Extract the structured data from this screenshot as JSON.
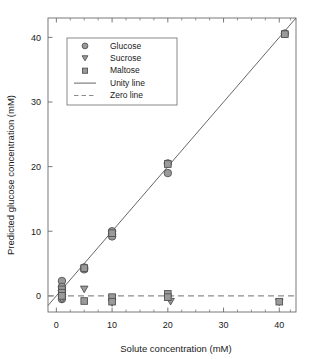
{
  "chart_data": {
    "type": "scatter",
    "title": "",
    "xlabel": "Solute concentration (mM)",
    "ylabel": "Predicted glucose concentration (mM)",
    "xlim": [
      -1.5,
      43
    ],
    "ylim": [
      -2.5,
      43
    ],
    "xticks": [
      0,
      10,
      20,
      30,
      40
    ],
    "yticks": [
      0,
      10,
      20,
      30,
      40
    ],
    "xtick_labels": [
      "0",
      "10",
      "20",
      "30",
      "40"
    ],
    "ytick_labels": [
      "0",
      "10",
      "20",
      "30",
      "40"
    ],
    "minor_xticks": [
      2.5,
      5,
      7.5,
      12.5,
      15,
      17.5,
      22.5,
      25,
      27.5,
      32.5,
      35,
      37.5,
      42
    ],
    "grid": false,
    "legend_position": "upper-left",
    "marker_fill": "#9a9a9a",
    "marker_edge": "#4d4d4d",
    "line_color": "#555555",
    "zero_line_color": "#8c8c8c",
    "frame_color": "#6b6b6b",
    "series": [
      {
        "name": "Glucose",
        "marker": "circle",
        "points": [
          [
            1.0,
            2.3
          ],
          [
            1.0,
            1.4
          ],
          [
            1.0,
            0.8
          ],
          [
            1.0,
            0.2
          ],
          [
            1.0,
            -0.5
          ],
          [
            5.0,
            4.4
          ],
          [
            5.0,
            4.1
          ],
          [
            10.0,
            10.0
          ],
          [
            10.0,
            9.5
          ],
          [
            10.0,
            9.2
          ],
          [
            20.0,
            20.5
          ],
          [
            20.0,
            19.0
          ],
          [
            41.0,
            40.6
          ]
        ]
      },
      {
        "name": "Sucrose",
        "marker": "triangle-down",
        "points": [
          [
            1.0,
            0.4
          ],
          [
            1.0,
            -0.1
          ],
          [
            1.0,
            -0.6
          ],
          [
            5.0,
            1.0
          ],
          [
            10.0,
            -0.4
          ],
          [
            10.0,
            -1.1
          ],
          [
            20.5,
            -0.9
          ],
          [
            40.0,
            -1.0
          ]
        ]
      },
      {
        "name": "Maltose",
        "marker": "square",
        "points": [
          [
            1.0,
            1.0
          ],
          [
            1.0,
            0.5
          ],
          [
            1.0,
            0.0
          ],
          [
            5.0,
            4.3
          ],
          [
            5.0,
            -0.8
          ],
          [
            10.0,
            9.7
          ],
          [
            10.0,
            -0.2
          ],
          [
            10.0,
            -0.9
          ],
          [
            20.0,
            20.4
          ],
          [
            20.0,
            0.3
          ],
          [
            20.0,
            -0.2
          ],
          [
            41.0,
            40.5
          ],
          [
            40.0,
            -0.9
          ]
        ]
      }
    ],
    "lines": [
      {
        "name": "Unity line",
        "style": "solid",
        "from": [
          -1.5,
          -1.5
        ],
        "to": [
          43,
          43
        ]
      },
      {
        "name": "Zero line",
        "style": "dashed",
        "from": [
          -1.5,
          0
        ],
        "to": [
          43,
          0
        ]
      }
    ],
    "legend_entries": [
      {
        "label": "Glucose",
        "kind": "marker",
        "marker": "circle"
      },
      {
        "label": "Sucrose",
        "kind": "marker",
        "marker": "triangle-down"
      },
      {
        "label": "Maltose",
        "kind": "marker",
        "marker": "square"
      },
      {
        "label": "Unity line",
        "kind": "line",
        "style": "solid"
      },
      {
        "label": "Zero line",
        "kind": "line",
        "style": "dashed"
      }
    ]
  }
}
